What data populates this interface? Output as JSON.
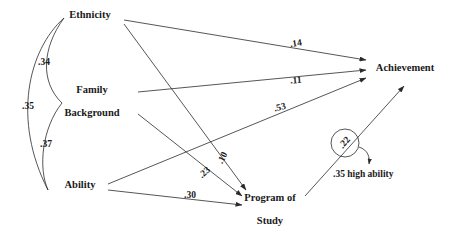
{
  "diagram": {
    "type": "path-diagram",
    "width": 450,
    "height": 242,
    "background_color": "#ffffff",
    "line_color": "#2b2b2b",
    "text_color": "#1a1a1a"
  },
  "nodes": [
    {
      "id": "ethnicity",
      "label": "Ethnicity",
      "x": 90,
      "y": 16
    },
    {
      "id": "family_l1",
      "label": "Family",
      "x": 92,
      "y": 91
    },
    {
      "id": "family_l2",
      "label": "Background",
      "x": 92,
      "y": 114
    },
    {
      "id": "ability",
      "label": "Ability",
      "x": 80,
      "y": 186
    },
    {
      "id": "program_l1",
      "label": "Program of",
      "x": 270,
      "y": 199
    },
    {
      "id": "program_l2",
      "label": "Study",
      "x": 270,
      "y": 222
    },
    {
      "id": "achievement",
      "label": "Achievement",
      "x": 405,
      "y": 69
    }
  ],
  "paths": [
    {
      "id": "eth-ach",
      "from": "Ethnicity",
      "to": "Achievement",
      "label": ".14",
      "label_x": 296,
      "label_y": 44,
      "rotate": -9
    },
    {
      "id": "fam-ach",
      "from": "Family Background",
      "to": "Achievement",
      "label": ".11",
      "label_x": 296,
      "label_y": 81,
      "rotate": -4
    },
    {
      "id": "abi-ach",
      "from": "Ability",
      "to": "Achievement",
      "label": ".53",
      "label_x": 280,
      "label_y": 108,
      "rotate": -13
    },
    {
      "id": "eth-prog",
      "from": "Ethnicity",
      "to": "Program of Study",
      "label": ".10",
      "label_x": 223,
      "label_y": 158,
      "rotate": -64
    },
    {
      "id": "fam-prog",
      "from": "Family Background",
      "to": "Program of Study",
      "label": ".23",
      "label_x": 205,
      "label_y": 173,
      "rotate": -42
    },
    {
      "id": "abi-prog",
      "from": "Ability",
      "to": "Program of Study",
      "label": ".30",
      "label_x": 190,
      "label_y": 196,
      "rotate": 0
    }
  ],
  "correlations": [
    {
      "id": "eth-fam",
      "between": [
        "Ethnicity",
        "Family Background"
      ],
      "label": ".34",
      "label_x": 44,
      "label_y": 63
    },
    {
      "id": "eth-abi",
      "between": [
        "Ethnicity",
        "Ability"
      ],
      "label": ".35",
      "label_x": 28,
      "label_y": 107
    },
    {
      "id": "fam-abi",
      "between": [
        "Family Background",
        "Ability"
      ],
      "label": ".37",
      "label_x": 46,
      "label_y": 145
    }
  ],
  "annotations": [
    {
      "id": "circled-value",
      "label": ".22",
      "x": 345,
      "y": 143,
      "rotate": -48,
      "circled": true,
      "circle_r": 14
    },
    {
      "id": "high-ability-note",
      "label": ".35 high ability",
      "x": 333,
      "y": 175
    }
  ]
}
